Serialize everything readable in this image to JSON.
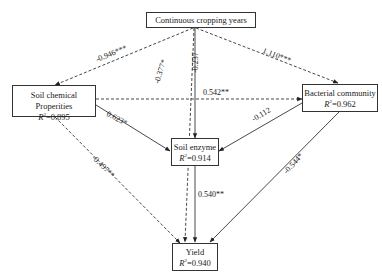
{
  "diagram": {
    "type": "path_analysis",
    "nodes": {
      "ccy": {
        "label": "Continuous cropping years"
      },
      "scp": {
        "label": "Soil chemical Properities",
        "r2_prefix": "R",
        "r2_value": "=0.895"
      },
      "bac": {
        "label": "Bacterial community",
        "r2_prefix": "R",
        "r2_value": "=0.962"
      },
      "enz": {
        "label": "Soil enzyme",
        "r2_prefix": "R",
        "r2_value": "=0.914"
      },
      "yld": {
        "label": "Yield",
        "r2_prefix": "R",
        "r2_value": "=0.940"
      }
    },
    "edges": [
      {
        "id": "ccy-scp",
        "from": "Continuous cropping years",
        "to": "Soil chemical Properities",
        "coef": "-0.946***",
        "style": "dashed"
      },
      {
        "id": "ccy-bac",
        "from": "Continuous cropping years",
        "to": "Bacterial community",
        "coef": "1.110***",
        "style": "dashed"
      },
      {
        "id": "ccy-enz",
        "from": "Continuous cropping years",
        "to": "Soil enzyme",
        "coef": "-0.237",
        "style": "solid"
      },
      {
        "id": "ccy-yld",
        "from": "Continuous cropping years",
        "to": "Yield",
        "coef": "-0.377*",
        "style": "dashed"
      },
      {
        "id": "scp-bac",
        "from": "Soil chemical Properities",
        "to": "Bacterial community",
        "coef": "0.542**",
        "style": "dashed"
      },
      {
        "id": "scp-enz",
        "from": "Soil chemical Properities",
        "to": "Soil enzyme",
        "coef": "0.623*",
        "style": "solid"
      },
      {
        "id": "scp-yld",
        "from": "Soil chemical Properities",
        "to": "Yield",
        "coef": "-0.497**",
        "style": "dashed"
      },
      {
        "id": "bac-enz",
        "from": "Bacterial community",
        "to": "Soil enzyme",
        "coef": "-0.112",
        "style": "solid"
      },
      {
        "id": "bac-yld",
        "from": "Bacterial community",
        "to": "Yield",
        "coef": "-0.544*",
        "style": "solid"
      },
      {
        "id": "enz-yld",
        "from": "Soil enzyme",
        "to": "Yield",
        "coef": "0.540**",
        "style": "solid"
      }
    ]
  }
}
